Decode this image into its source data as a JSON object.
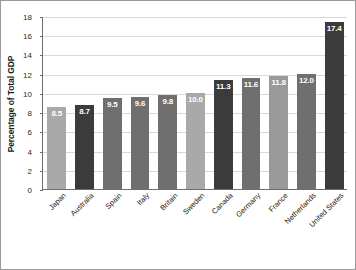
{
  "chart_data": {
    "type": "bar",
    "title": "",
    "xlabel": "",
    "ylabel": "Percentage of Total GDP",
    "ylim": [
      0,
      18
    ],
    "yticks": [
      0,
      2,
      4,
      6,
      8,
      10,
      12,
      14,
      16,
      18
    ],
    "grid": true,
    "legend": "none",
    "categories": [
      "Japan",
      "Australia",
      "Spain",
      "Italy",
      "Britain",
      "Sweden",
      "Canada",
      "Germany",
      "France",
      "Netherlands",
      "United States"
    ],
    "values": [
      8.5,
      8.7,
      9.5,
      9.6,
      9.8,
      10.0,
      11.3,
      11.6,
      11.8,
      12.0,
      17.4
    ],
    "value_labels": [
      "8.5",
      "8.7",
      "9.5",
      "9.6",
      "9.8",
      "10.0",
      "11.3",
      "11.6",
      "11.8",
      "12.0",
      "17.4"
    ],
    "bar_colors": [
      "#a9a9a9",
      "#3b3b3b",
      "#6f6f6f",
      "#6f6f6f",
      "#6f6f6f",
      "#a9a9a9",
      "#3b3b3b",
      "#6f6f6f",
      "#9a9a9a",
      "#6f6f6f",
      "#3b3b3b"
    ]
  },
  "axis": {
    "y_title": "Percentage of Total GDP",
    "y_tick_labels": [
      "0",
      "2",
      "4",
      "6",
      "8",
      "10",
      "12",
      "14",
      "16",
      "18"
    ]
  },
  "colors": {
    "frame": "#9a9a9a",
    "axis_line": "#6e6e6e",
    "gridline": "#d9d9d9",
    "label_text": "#1a1a1a",
    "value_text": "#ffffff",
    "background": "#ffffff"
  }
}
